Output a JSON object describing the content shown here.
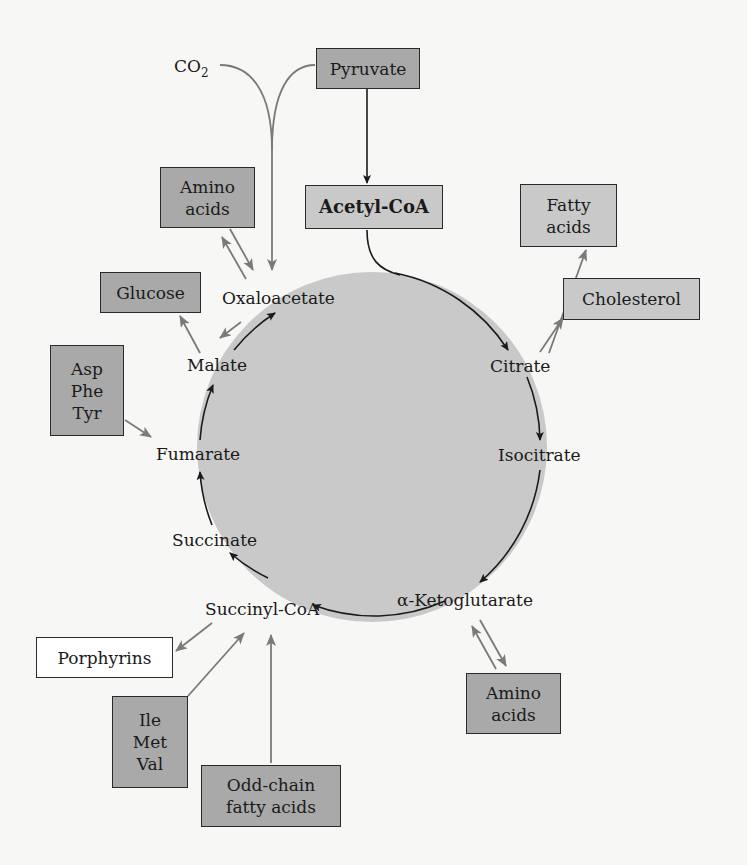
{
  "diagram": {
    "type": "citric acid cycle — amphibolic pathways",
    "cycle_color": "#c9c9c9",
    "cycle_intermediates": [
      {
        "id": "oxaloacetate",
        "label": "Oxaloacetate"
      },
      {
        "id": "citrate",
        "label": "Citrate"
      },
      {
        "id": "isocitrate",
        "label": "Isocitrate"
      },
      {
        "id": "alpha-ketoglutarate",
        "label": "α-Ketoglutarate"
      },
      {
        "id": "succinyl-coa",
        "label": "Succinyl-CoA"
      },
      {
        "id": "succinate",
        "label": "Succinate"
      },
      {
        "id": "fumarate",
        "label": "Fumarate"
      },
      {
        "id": "malate",
        "label": "Malate"
      }
    ],
    "boxes": {
      "pyruvate": {
        "label": "Pyruvate"
      },
      "acetyl_coa": {
        "label": "Acetyl-CoA"
      },
      "amino_acids_top": {
        "lines": [
          "Amino",
          "acids"
        ]
      },
      "glucose": {
        "label": "Glucose"
      },
      "asp_phe_tyr": {
        "lines": [
          "Asp",
          "Phe",
          "Tyr"
        ]
      },
      "fatty_acids": {
        "lines": [
          "Fatty",
          "acids"
        ]
      },
      "cholesterol": {
        "label": "Cholesterol"
      },
      "porphyrins": {
        "label": "Porphyrins"
      },
      "ile_met_val": {
        "lines": [
          "Ile",
          "Met",
          "Val"
        ]
      },
      "odd_chain": {
        "lines": [
          "Odd-chain",
          "fatty acids"
        ]
      },
      "amino_acids_bottom": {
        "lines": [
          "Amino",
          "acids"
        ]
      }
    },
    "co2": {
      "label": "CO",
      "subscript": "2"
    },
    "edges": [
      {
        "from": "Pyruvate",
        "to": "Acetyl-CoA"
      },
      {
        "from": "Acetyl-CoA",
        "to": "Citrate"
      },
      {
        "from": "Pyruvate",
        "to": "Oxaloacetate",
        "with": "CO2"
      },
      {
        "from": "Amino acids",
        "to": "Oxaloacetate",
        "bidirectional": true
      },
      {
        "from": "Malate",
        "to": "Glucose"
      },
      {
        "from": "Oxaloacetate",
        "to": "Malate"
      },
      {
        "from": "Asp/Phe/Tyr",
        "to": "Fumarate"
      },
      {
        "from": "Citrate",
        "to": "Fatty acids"
      },
      {
        "from": "Citrate",
        "to": "Cholesterol"
      },
      {
        "from": "α-Ketoglutarate",
        "to": "Amino acids",
        "bidirectional": true
      },
      {
        "from": "Succinyl-CoA",
        "to": "Porphyrins"
      },
      {
        "from": "Ile/Met/Val",
        "to": "Succinyl-CoA"
      },
      {
        "from": "Odd-chain fatty acids",
        "to": "Succinyl-CoA"
      }
    ]
  }
}
